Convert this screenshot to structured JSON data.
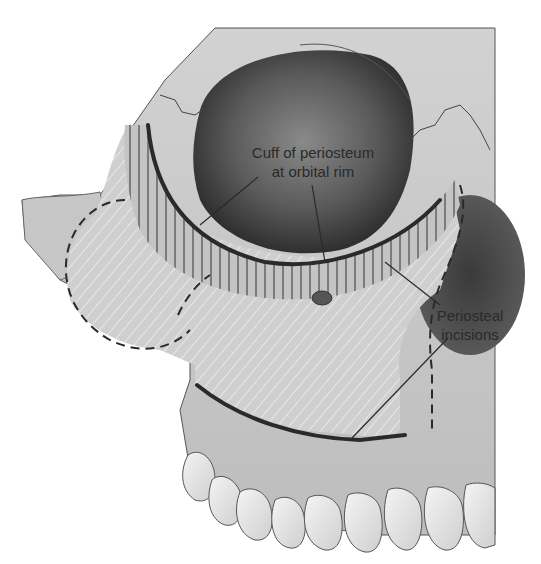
{
  "figure": {
    "type": "anatomical-illustration",
    "background": "#ffffff",
    "bone_color": "#c9c9c9",
    "orbit_shadow_color": "#3a3a3a",
    "line_color": "#2a2a2a"
  },
  "labels": {
    "cuff": {
      "line1": "Cuff of periosteum",
      "line2": "at orbital rim"
    },
    "incisions": {
      "line1": "Periosteal",
      "line2": "incisions"
    }
  }
}
